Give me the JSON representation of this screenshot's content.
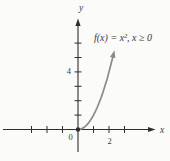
{
  "chart_data": {
    "type": "line",
    "title": "",
    "function_annotation": "f(x) = x², x ≥ 0",
    "xlabel": "x",
    "ylabel": "y",
    "origin_label": "0",
    "x": [
      0,
      0.125,
      0.25,
      0.375,
      0.5,
      0.625,
      0.75,
      0.875,
      1,
      1.125,
      1.25,
      1.375,
      1.5,
      1.625,
      1.75,
      1.875,
      2,
      2.125,
      2.25
    ],
    "y": [
      0,
      0.016,
      0.063,
      0.141,
      0.25,
      0.391,
      0.563,
      0.766,
      1,
      1.266,
      1.563,
      1.891,
      2.25,
      2.641,
      3.063,
      3.516,
      4,
      4.516,
      5.063
    ],
    "x_ticks": [
      -3,
      -2,
      -1,
      1,
      2,
      3
    ],
    "y_ticks": [
      1,
      2,
      3,
      4,
      5,
      6
    ],
    "labeled_x_tick": {
      "value": 2,
      "label": "2"
    },
    "labeled_y_tick": {
      "value": 4,
      "label": "4"
    },
    "xlim": [
      -4.8,
      5.9
    ],
    "ylim": [
      -2.2,
      7.7
    ],
    "grid": false,
    "legend": "none",
    "start_point": {
      "x": 0,
      "y": 0,
      "style": "closed-dot"
    },
    "curve_end": "arrowhead",
    "colors": {
      "curve": "#8a8a8a",
      "axis": "#2e2e2e",
      "text": "#3a3a3a",
      "background": "#fbfbfa"
    }
  }
}
